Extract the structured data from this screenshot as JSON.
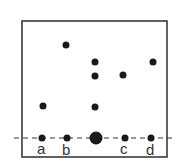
{
  "diagram": {
    "frame": {
      "x": 22,
      "y": 21,
      "width": 145,
      "height": 136
    },
    "baseline": {
      "y": 138,
      "x1": 14,
      "x2": 172,
      "style": "dashed"
    },
    "points": [
      {
        "x": 66,
        "y": 45,
        "r": 3.5
      },
      {
        "x": 43,
        "y": 106,
        "r": 3.5
      },
      {
        "x": 95,
        "y": 62,
        "r": 3.5
      },
      {
        "x": 95,
        "y": 76,
        "r": 3.5
      },
      {
        "x": 95,
        "y": 107,
        "r": 3.5
      },
      {
        "x": 123,
        "y": 75,
        "r": 3.5
      },
      {
        "x": 153,
        "y": 62,
        "r": 3.5
      }
    ],
    "baseline_points": [
      {
        "x": 42,
        "y": 138,
        "r": 3.5,
        "label": "a"
      },
      {
        "x": 67,
        "y": 138,
        "r": 3.5,
        "label": "b"
      },
      {
        "x": 96,
        "y": 138,
        "r": 6.5,
        "label": ""
      },
      {
        "x": 125,
        "y": 138,
        "r": 3.5,
        "label": "c"
      },
      {
        "x": 151,
        "y": 138,
        "r": 3.5,
        "label": "d"
      }
    ],
    "labels": {
      "a": "a",
      "b": "b",
      "c": "c",
      "d": "d"
    },
    "colors": {
      "dot": "#1a1a1a",
      "frame": "#3a3a3a"
    }
  }
}
